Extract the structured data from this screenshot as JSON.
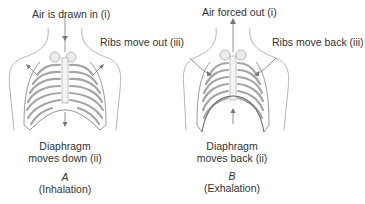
{
  "figures": [
    {
      "id": "A",
      "letter": "A",
      "caption": "(Inhalation)",
      "air_label": "Air is drawn in (i)",
      "ribs_label": "Ribs move out (iii)",
      "diaphragm_line1": "Diaphragm",
      "diaphragm_line2": "moves down (ii)"
    },
    {
      "id": "B",
      "letter": "B",
      "caption": "(Exhalation)",
      "air_label": "Air forced out (i)",
      "ribs_label": "Ribs move back (iii)",
      "diaphragm_line1": "Diaphragm",
      "diaphragm_line2": "moves back (ii)"
    }
  ],
  "colors": {
    "line": "#9a9a9a",
    "rib_fill": "#e9e9e9",
    "arrow": "#777777",
    "text": "#333333"
  }
}
